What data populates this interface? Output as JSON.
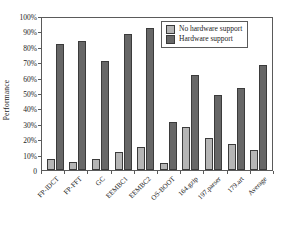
{
  "chart_data": {
    "type": "bar",
    "title": "",
    "xlabel": "",
    "ylabel": "Performance",
    "ylim": [
      0,
      100
    ],
    "yticks": [
      "0",
      "10%",
      "20%",
      "30%",
      "40%",
      "50%",
      "60%",
      "70%",
      "80%",
      "90%",
      "100%"
    ],
    "ytick_values": [
      0,
      10,
      20,
      30,
      40,
      50,
      60,
      70,
      80,
      90,
      100
    ],
    "grid": false,
    "legend_position": "top-right",
    "categories": [
      "FP-IDCT",
      "FP-FFT",
      "GC",
      "EEMBC1",
      "EEMBC2",
      "OS-BOOT",
      "164.gzip",
      "197.parser",
      "179.art",
      "Average"
    ],
    "series": [
      {
        "name": "No hardware support",
        "color": "#b5b5b5",
        "values": [
          7,
          5,
          7,
          12,
          15,
          4.5,
          28,
          20.5,
          17,
          13
        ]
      },
      {
        "name": "Hardware support",
        "color": "#676767",
        "values": [
          82,
          84,
          71,
          88,
          92,
          31,
          62,
          49,
          53,
          68
        ]
      }
    ]
  },
  "legend": {
    "entries": [
      {
        "label": "No hardware support",
        "swatch": "light"
      },
      {
        "label": "Hardware support",
        "swatch": "dark"
      }
    ]
  }
}
